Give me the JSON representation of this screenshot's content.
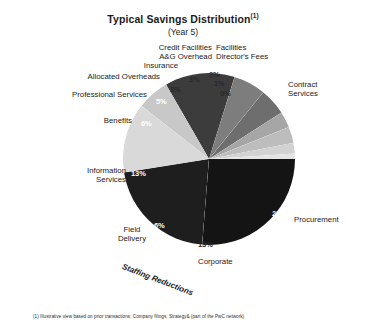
{
  "header": {
    "title": "Typical Savings Distribution",
    "title_superscript": "(1)",
    "subtitle": "(Year 5)"
  },
  "footnote": {
    "text": "(1) Illustrative view based on prior transactions; Company filings; Strategy& (part of the PwC network)"
  },
  "annotations": {
    "staffing_reductions": "Staffing Reductions"
  },
  "chart_data": {
    "type": "pie",
    "subtitle": "(Year 5)",
    "ylabel": "",
    "xlabel": "",
    "legend_position": "callout-labels",
    "units": "percent",
    "start_angle_deg": 0,
    "direction": "clockwise",
    "categories": [
      "Contract Services",
      "Procurement",
      "Corporate",
      "Field Delivery",
      "Information Services",
      "Benefits",
      "Professional Services",
      "Allocated Overheads",
      "A&G Overhead",
      "Insurance",
      "Credit Facilities",
      "Facilities Director's Fees"
    ],
    "values": [
      26,
      21,
      13,
      6,
      13,
      6,
      5,
      3,
      3,
      2,
      1,
      0
    ],
    "value_labels": [
      "26%",
      "21%",
      "13%",
      "6%",
      "13%",
      "6%",
      "5%",
      "3%",
      "3%",
      "2%",
      "1%",
      "0%"
    ],
    "colors": [
      "#141414",
      "#1e1e1e",
      "#d9d9d9",
      "#c8c8c8",
      "#3c3c3c",
      "#7d7d7d",
      "#6e6e6e",
      "#a6a6a6",
      "#bdbdbd",
      "#d2d2d2",
      "#e4e4e4",
      "#f2f2f2"
    ]
  },
  "slices": [
    {
      "name": "Contract Services",
      "label": "Contract\nServices",
      "label_line1": "Contract",
      "label_line2": "Services",
      "percent": "26%"
    },
    {
      "name": "Procurement",
      "label": "Procurement",
      "percent": "21%"
    },
    {
      "name": "Corporate",
      "label": "Corporate",
      "percent": "13%"
    },
    {
      "name": "Field Delivery",
      "label_line1": "Field",
      "label_line2": "Delivery",
      "percent": "6%"
    },
    {
      "name": "Information Services",
      "label_line1": "Information",
      "label_line2": "Services",
      "percent": "13%"
    },
    {
      "name": "Benefits",
      "label": "Benefits",
      "percent": "6%"
    },
    {
      "name": "Professional Services",
      "label": "Professional Services",
      "percent": "5%"
    },
    {
      "name": "Allocated Overheads",
      "label": "Allocated Overheads",
      "percent": "3%"
    },
    {
      "name": "A&G Overhead",
      "label_line1": "Credit Facilities",
      "label_line2": "A&G Overhead",
      "percent": "3%"
    },
    {
      "name": "Insurance",
      "label": "Insurance",
      "percent": "2%"
    },
    {
      "name": "Credit Facilities",
      "label": "Credit Facilities",
      "percent": "1%"
    },
    {
      "name": "Facilities Director's Fees",
      "label_line1": "Facilities",
      "label_line2": "Director's Fees",
      "percent": "0%"
    }
  ]
}
